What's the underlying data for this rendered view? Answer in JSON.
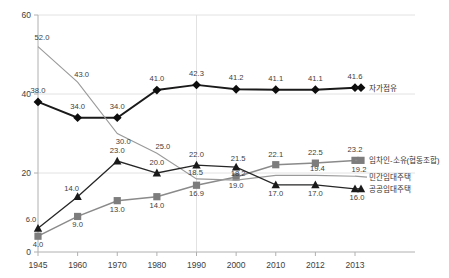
{
  "title": "",
  "chart_data": {
    "type": "line",
    "title": "",
    "xlabel": "",
    "ylabel": "",
    "ylim": [
      0,
      60
    ],
    "yticks": [
      "0",
      "20",
      "40",
      "60"
    ],
    "grid": true,
    "legend_position": "right",
    "categories": [
      "1945",
      "1960",
      "1970",
      "1980",
      "1990",
      "2000",
      "2010",
      "2012",
      "2013"
    ],
    "series": [
      {
        "name": "자가점유",
        "marker": "diamond",
        "color": "#0d0d0d",
        "values": [
          38.0,
          34.0,
          34.0,
          41.0,
          42.3,
          41.2,
          41.1,
          41.1,
          41.6
        ],
        "labels": [
          "38.0",
          "34.0",
          "34.0",
          "41.0",
          "42.3",
          "41.2",
          "41.1",
          "41.1",
          "41.6"
        ]
      },
      {
        "name": "임차인-소유(협동조합)",
        "marker": "square",
        "color": "#7d7d7d",
        "values": [
          4.0,
          9.0,
          13.0,
          14.0,
          16.9,
          19.0,
          22.1,
          22.5,
          23.2
        ],
        "labels": [
          "4.0",
          "9.0",
          "13.0",
          "14.0",
          "16.9",
          "19.0",
          "22.1",
          "22.5",
          "23.2"
        ]
      },
      {
        "name": "민간임대주택",
        "marker": "none",
        "color": "#9a9a9a",
        "values": [
          52.0,
          43.0,
          30.0,
          25.0,
          18.5,
          18.2,
          19.4,
          19.4,
          19.2
        ],
        "labels": [
          "52.0",
          "43.0",
          "30.0",
          "25.0",
          "18.5",
          "18.2",
          "",
          "19.4",
          "19.2"
        ]
      },
      {
        "name": "공공임대주택",
        "marker": "triangle",
        "color": "#1a1a1a",
        "values": [
          6.0,
          14.0,
          23.0,
          20.0,
          22.0,
          21.5,
          17.0,
          17.0,
          16.0
        ],
        "labels": [
          "6.0",
          "14.0",
          "23.0",
          "20.0",
          "22.0",
          "21.5",
          "17.0",
          "17.0",
          "16.0"
        ]
      }
    ]
  }
}
